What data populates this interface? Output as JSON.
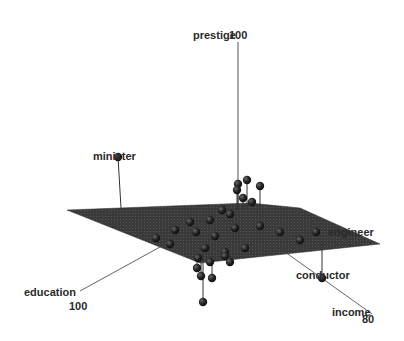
{
  "chart_data": {
    "type": "scatter",
    "subtype": "3d-scatter-with-regression-plane",
    "title": "",
    "axes": {
      "x": {
        "label": "income",
        "max_tick": "80"
      },
      "y": {
        "label": "education",
        "max_tick": "100"
      },
      "z": {
        "label": "prestige",
        "max_tick": "100"
      }
    },
    "labeled_points": [
      "minister",
      "engineer",
      "conductor"
    ],
    "plane": {
      "fill": "#3a3a3a",
      "description": "fitted regression plane"
    },
    "point_color": "#1e1e1e",
    "grid": false,
    "legend": null,
    "points_screen": [
      {
        "x": 118,
        "y": 157,
        "label": "minister",
        "drop_to": 207
      },
      {
        "x": 238,
        "y": 184
      },
      {
        "x": 247,
        "y": 180
      },
      {
        "x": 260,
        "y": 186
      },
      {
        "x": 237,
        "y": 190
      },
      {
        "x": 243,
        "y": 198
      },
      {
        "x": 252,
        "y": 202
      },
      {
        "x": 222,
        "y": 210
      },
      {
        "x": 230,
        "y": 214
      },
      {
        "x": 210,
        "y": 220
      },
      {
        "x": 190,
        "y": 222
      },
      {
        "x": 175,
        "y": 230
      },
      {
        "x": 156,
        "y": 238
      },
      {
        "x": 170,
        "y": 244
      },
      {
        "x": 196,
        "y": 232
      },
      {
        "x": 215,
        "y": 236
      },
      {
        "x": 235,
        "y": 228
      },
      {
        "x": 260,
        "y": 226
      },
      {
        "x": 280,
        "y": 232
      },
      {
        "x": 300,
        "y": 240
      },
      {
        "x": 205,
        "y": 248
      },
      {
        "x": 225,
        "y": 252
      },
      {
        "x": 245,
        "y": 248
      },
      {
        "x": 198,
        "y": 258
      },
      {
        "x": 210,
        "y": 262
      },
      {
        "x": 225,
        "y": 256
      },
      {
        "x": 230,
        "y": 262
      },
      {
        "x": 197,
        "y": 268
      },
      {
        "x": 201,
        "y": 276
      },
      {
        "x": 212,
        "y": 278
      },
      {
        "x": 203,
        "y": 302
      },
      {
        "x": 316,
        "y": 232,
        "label": "engineer"
      },
      {
        "x": 322,
        "y": 278,
        "label": "conductor",
        "drop_from": 244
      }
    ]
  },
  "labels": {
    "prestige": "prestige",
    "prestige_tick": "100",
    "minister": "minister",
    "engineer": "engineer",
    "conductor": "conductor",
    "education": "education",
    "education_tick": "100",
    "income": "income",
    "income_tick": "80"
  }
}
